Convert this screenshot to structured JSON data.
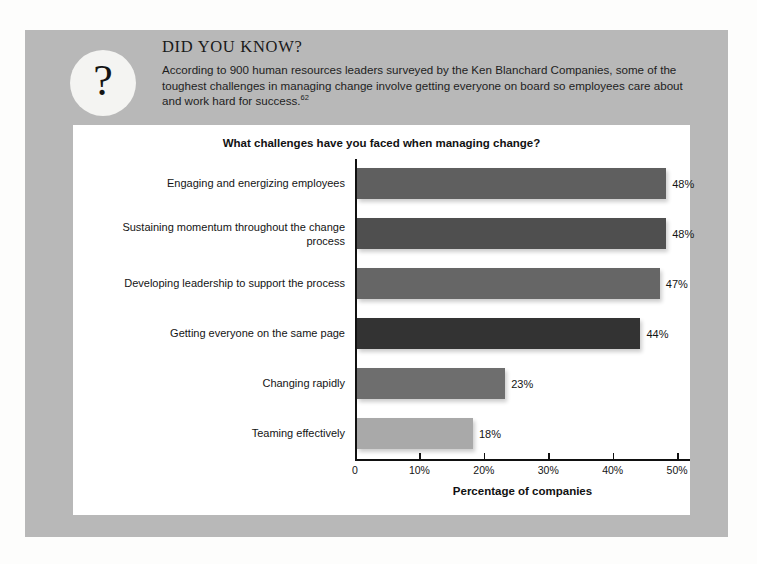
{
  "callout": {
    "icon": "question-mark-icon",
    "icon_glyph": "?",
    "title": "DID YOU KNOW?",
    "body": "According to 900 human resources leaders surveyed by the Ken Blanchard Companies, some of the toughest challenges in managing change involve getting everyone on board so employees care about and work hard for success.",
    "footnote_ref": "62",
    "panel_color": "#b8b8b8"
  },
  "chart_data": {
    "type": "bar",
    "orientation": "horizontal",
    "title": "What challenges have you faced when managing change?",
    "xlabel": "Percentage of companies",
    "ylabel": "",
    "xlim": [
      0,
      52
    ],
    "grid": false,
    "legend": "none",
    "xticks": [
      "0",
      "10%",
      "20%",
      "30%",
      "40%",
      "50%"
    ],
    "xtick_values": [
      0,
      10,
      20,
      30,
      40,
      50
    ],
    "categories": [
      "Engaging and energizing employees",
      "Sustaining momentum throughout the change process",
      "Developing leadership to support the process",
      "Getting everyone on the same page",
      "Changing rapidly",
      "Teaming effectively"
    ],
    "values": [
      48,
      48,
      47,
      44,
      23,
      18
    ],
    "data_labels": [
      "48%",
      "48%",
      "47%",
      "44%",
      "23%",
      "18%"
    ],
    "bar_colors": [
      "#5f5f5f",
      "#4f4f4f",
      "#666666",
      "#333333",
      "#6e6e6e",
      "#a9a9a9"
    ],
    "panel_background": "#ffffff"
  }
}
